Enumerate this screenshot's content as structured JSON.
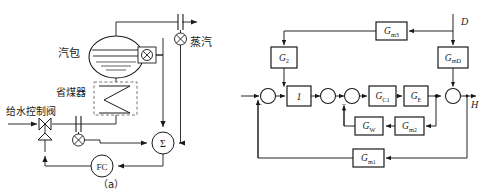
{
  "figure": {
    "panel_a": {
      "caption": "（a）",
      "labels": {
        "drum": "汽包",
        "economizer": "省煤器",
        "feedwater_valve": "给水控制阀",
        "steam": "蒸汽",
        "summer": "Σ",
        "controller": "FC"
      },
      "symbols": {
        "flow_element": "orifice-plate",
        "transmitter": "crossed-circle",
        "valve": "bowtie-valve",
        "drum_vessel": "horizontal-drum",
        "economizer_coil": "zigzag-coil"
      }
    },
    "panel_b": {
      "caption": "（b）",
      "signals": {
        "disturbance": "D",
        "output": "H"
      },
      "blocks": [
        {
          "id": "gm3",
          "label": "G",
          "sub": "m3",
          "name": "block-gm3"
        },
        {
          "id": "gmd",
          "label": "G",
          "sub": "mD",
          "name": "block-gmd"
        },
        {
          "id": "g2",
          "label": "G",
          "sub": "2",
          "name": "block-g2"
        },
        {
          "id": "one",
          "label": "1",
          "sub": "",
          "name": "block-one"
        },
        {
          "id": "gc1",
          "label": "G",
          "sub": "C1",
          "name": "block-gc1"
        },
        {
          "id": "ge",
          "label": "G",
          "sub": "E",
          "name": "block-ge"
        },
        {
          "id": "gf1",
          "label": "G",
          "sub": "F1",
          "name": "block-gf1"
        },
        {
          "id": "gw",
          "label": "G",
          "sub": "W",
          "name": "block-gw"
        },
        {
          "id": "gm2",
          "label": "G",
          "sub": "m2",
          "name": "block-gm2"
        },
        {
          "id": "gm1",
          "label": "G",
          "sub": "m1",
          "name": "block-gm1"
        }
      ],
      "summing_junctions": [
        {
          "id": "sum1",
          "signs": [
            "-"
          ]
        },
        {
          "id": "sum2",
          "signs": []
        },
        {
          "id": "sum3",
          "signs": [
            "-"
          ]
        },
        {
          "id": "sum4",
          "signs": []
        }
      ],
      "sign_minus": "−"
    }
  },
  "style": {
    "line_color": "#1a1a1a",
    "fill_color": "#ffffff",
    "dashed_color": "#555555"
  }
}
